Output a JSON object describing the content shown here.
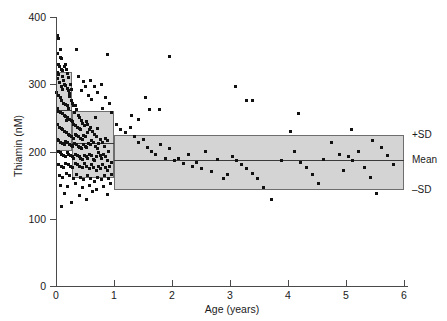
{
  "chart_data": {
    "type": "scatter",
    "title": "",
    "xlabel": "Age (years)",
    "ylabel": "Thiamin (nM)",
    "xlim": [
      0,
      6
    ],
    "ylim": [
      0,
      400
    ],
    "xticks": [
      0,
      1,
      2,
      3,
      4,
      5,
      6
    ],
    "yticks": [
      0,
      100,
      200,
      300,
      400
    ],
    "xtick_labels": [
      "0",
      "1",
      "2",
      "3",
      "4",
      "5",
      "6"
    ],
    "ytick_labels": [
      "0",
      "100",
      "200",
      "300",
      "400"
    ],
    "grid": false,
    "legend": "none",
    "marker": "square",
    "marker_color": "#111111",
    "band_fill_color": "#d4d4d4",
    "band_edge_color": "#6e6e6e",
    "annotations": [
      {
        "label": "+SD",
        "value": 225
      },
      {
        "label": "Mean",
        "value": 187
      },
      {
        "label": "–SD",
        "value": 143
      }
    ],
    "reference_bands": [
      {
        "age_from": 0.0,
        "age_to": 0.28,
        "minus_sd": 200,
        "mean": 262,
        "plus_sd": 318
      },
      {
        "age_from": 0.28,
        "age_to": 1.0,
        "minus_sd": 160,
        "mean": 213,
        "plus_sd": 260
      },
      {
        "age_from": 1.0,
        "age_to": 6.0,
        "minus_sd": 143,
        "mean": 187,
        "plus_sd": 225
      }
    ],
    "points": [
      [
        0.02,
        372
      ],
      [
        0.05,
        368
      ],
      [
        0.08,
        352
      ],
      [
        0.03,
        345
      ],
      [
        0.07,
        340
      ],
      [
        0.1,
        338
      ],
      [
        0.04,
        330
      ],
      [
        0.06,
        326
      ],
      [
        0.09,
        322
      ],
      [
        0.12,
        320
      ],
      [
        0.02,
        318
      ],
      [
        0.05,
        314
      ],
      [
        0.11,
        312
      ],
      [
        0.14,
        326
      ],
      [
        0.16,
        330
      ],
      [
        0.18,
        322
      ],
      [
        0.2,
        316
      ],
      [
        0.22,
        310
      ],
      [
        0.13,
        305
      ],
      [
        0.15,
        300
      ],
      [
        0.17,
        298
      ],
      [
        0.19,
        294
      ],
      [
        0.21,
        290
      ],
      [
        0.23,
        286
      ],
      [
        0.03,
        308
      ],
      [
        0.06,
        302
      ],
      [
        0.09,
        296
      ],
      [
        0.12,
        292
      ],
      [
        0.01,
        288
      ],
      [
        0.04,
        284
      ],
      [
        0.07,
        280
      ],
      [
        0.1,
        276
      ],
      [
        0.13,
        272
      ],
      [
        0.16,
        270
      ],
      [
        0.19,
        268
      ],
      [
        0.22,
        264
      ],
      [
        0.25,
        300
      ],
      [
        0.27,
        292
      ],
      [
        0.24,
        282
      ],
      [
        0.26,
        276
      ],
      [
        0.28,
        272
      ],
      [
        0.3,
        268
      ],
      [
        0.02,
        264
      ],
      [
        0.05,
        260
      ],
      [
        0.08,
        258
      ],
      [
        0.11,
        256
      ],
      [
        0.14,
        254
      ],
      [
        0.17,
        252
      ],
      [
        0.2,
        250
      ],
      [
        0.23,
        248
      ],
      [
        0.26,
        246
      ],
      [
        0.29,
        244
      ],
      [
        0.32,
        258
      ],
      [
        0.35,
        262
      ],
      [
        0.38,
        254
      ],
      [
        0.41,
        250
      ],
      [
        0.44,
        246
      ],
      [
        0.31,
        240
      ],
      [
        0.34,
        238
      ],
      [
        0.37,
        236
      ],
      [
        0.4,
        234
      ],
      [
        0.43,
        232
      ],
      [
        0.46,
        242
      ],
      [
        0.49,
        238
      ],
      [
        0.52,
        244
      ],
      [
        0.55,
        240
      ],
      [
        0.03,
        240
      ],
      [
        0.06,
        236
      ],
      [
        0.09,
        234
      ],
      [
        0.12,
        232
      ],
      [
        0.15,
        230
      ],
      [
        0.18,
        228
      ],
      [
        0.21,
        226
      ],
      [
        0.24,
        224
      ],
      [
        0.27,
        222
      ],
      [
        0.3,
        220
      ],
      [
        0.33,
        226
      ],
      [
        0.36,
        224
      ],
      [
        0.39,
        222
      ],
      [
        0.42,
        220
      ],
      [
        0.45,
        218
      ],
      [
        0.48,
        224
      ],
      [
        0.51,
        222
      ],
      [
        0.54,
        228
      ],
      [
        0.57,
        232
      ],
      [
        0.6,
        236
      ],
      [
        0.63,
        230
      ],
      [
        0.66,
        226
      ],
      [
        0.69,
        222
      ],
      [
        0.72,
        234
      ],
      [
        0.02,
        218
      ],
      [
        0.05,
        216
      ],
      [
        0.08,
        214
      ],
      [
        0.11,
        212
      ],
      [
        0.14,
        210
      ],
      [
        0.17,
        215
      ],
      [
        0.2,
        213
      ],
      [
        0.23,
        211
      ],
      [
        0.26,
        209
      ],
      [
        0.29,
        207
      ],
      [
        0.32,
        212
      ],
      [
        0.35,
        210
      ],
      [
        0.38,
        208
      ],
      [
        0.41,
        206
      ],
      [
        0.44,
        204
      ],
      [
        0.47,
        210
      ],
      [
        0.5,
        208
      ],
      [
        0.53,
        206
      ],
      [
        0.56,
        212
      ],
      [
        0.59,
        210
      ],
      [
        0.62,
        216
      ],
      [
        0.65,
        214
      ],
      [
        0.68,
        208
      ],
      [
        0.71,
        204
      ],
      [
        0.74,
        212
      ],
      [
        0.77,
        218
      ],
      [
        0.8,
        214
      ],
      [
        0.83,
        208
      ],
      [
        0.86,
        220
      ],
      [
        0.89,
        216
      ],
      [
        0.04,
        200
      ],
      [
        0.07,
        198
      ],
      [
        0.1,
        196
      ],
      [
        0.13,
        194
      ],
      [
        0.16,
        192
      ],
      [
        0.19,
        198
      ],
      [
        0.22,
        196
      ],
      [
        0.25,
        194
      ],
      [
        0.28,
        192
      ],
      [
        0.31,
        190
      ],
      [
        0.34,
        196
      ],
      [
        0.37,
        194
      ],
      [
        0.4,
        192
      ],
      [
        0.43,
        190
      ],
      [
        0.46,
        188
      ],
      [
        0.49,
        194
      ],
      [
        0.52,
        192
      ],
      [
        0.55,
        190
      ],
      [
        0.58,
        196
      ],
      [
        0.61,
        194
      ],
      [
        0.64,
        188
      ],
      [
        0.67,
        186
      ],
      [
        0.7,
        192
      ],
      [
        0.73,
        198
      ],
      [
        0.76,
        194
      ],
      [
        0.79,
        190
      ],
      [
        0.82,
        196
      ],
      [
        0.85,
        192
      ],
      [
        0.88,
        186
      ],
      [
        0.91,
        200
      ],
      [
        0.05,
        180
      ],
      [
        0.09,
        178
      ],
      [
        0.13,
        176
      ],
      [
        0.17,
        182
      ],
      [
        0.21,
        180
      ],
      [
        0.25,
        178
      ],
      [
        0.29,
        176
      ],
      [
        0.33,
        182
      ],
      [
        0.37,
        180
      ],
      [
        0.41,
        178
      ],
      [
        0.45,
        176
      ],
      [
        0.49,
        182
      ],
      [
        0.53,
        178
      ],
      [
        0.57,
        174
      ],
      [
        0.61,
        180
      ],
      [
        0.65,
        176
      ],
      [
        0.69,
        172
      ],
      [
        0.73,
        178
      ],
      [
        0.77,
        174
      ],
      [
        0.81,
        180
      ],
      [
        0.85,
        176
      ],
      [
        0.89,
        172
      ],
      [
        0.93,
        178
      ],
      [
        0.96,
        184
      ],
      [
        0.06,
        165
      ],
      [
        0.12,
        162
      ],
      [
        0.18,
        168
      ],
      [
        0.24,
        164
      ],
      [
        0.3,
        160
      ],
      [
        0.36,
        166
      ],
      [
        0.42,
        162
      ],
      [
        0.48,
        158
      ],
      [
        0.54,
        164
      ],
      [
        0.6,
        160
      ],
      [
        0.66,
        156
      ],
      [
        0.72,
        162
      ],
      [
        0.78,
        158
      ],
      [
        0.84,
        164
      ],
      [
        0.9,
        160
      ],
      [
        0.95,
        166
      ],
      [
        0.08,
        150
      ],
      [
        0.2,
        148
      ],
      [
        0.34,
        152
      ],
      [
        0.46,
        146
      ],
      [
        0.58,
        150
      ],
      [
        0.7,
        144
      ],
      [
        0.82,
        148
      ],
      [
        0.94,
        152
      ],
      [
        0.15,
        138
      ],
      [
        0.4,
        134
      ],
      [
        0.63,
        140
      ],
      [
        0.88,
        136
      ],
      [
        0.1,
        118
      ],
      [
        0.26,
        124
      ],
      [
        0.52,
        128
      ],
      [
        0.34,
        268
      ],
      [
        0.44,
        290
      ],
      [
        0.5,
        296
      ],
      [
        0.56,
        284
      ],
      [
        0.62,
        278
      ],
      [
        0.48,
        304
      ],
      [
        0.38,
        312
      ],
      [
        0.66,
        296
      ],
      [
        0.72,
        288
      ],
      [
        0.78,
        300
      ],
      [
        0.6,
        306
      ],
      [
        0.86,
        280
      ],
      [
        0.92,
        272
      ],
      [
        0.8,
        264
      ],
      [
        0.96,
        258
      ],
      [
        0.68,
        250
      ],
      [
        1.05,
        240
      ],
      [
        1.12,
        232
      ],
      [
        1.2,
        228
      ],
      [
        1.28,
        236
      ],
      [
        1.35,
        222
      ],
      [
        1.42,
        214
      ],
      [
        1.5,
        218
      ],
      [
        1.58,
        206
      ],
      [
        1.65,
        200
      ],
      [
        1.72,
        196
      ],
      [
        1.8,
        210
      ],
      [
        1.88,
        190
      ],
      [
        1.95,
        204
      ],
      [
        1.55,
        280
      ],
      [
        1.62,
        262
      ],
      [
        1.78,
        262
      ],
      [
        1.3,
        254
      ],
      [
        1.42,
        248
      ],
      [
        2.05,
        186
      ],
      [
        2.12,
        190
      ],
      [
        2.2,
        182
      ],
      [
        2.28,
        196
      ],
      [
        2.35,
        178
      ],
      [
        2.42,
        184
      ],
      [
        2.5,
        174
      ],
      [
        2.58,
        200
      ],
      [
        2.68,
        170
      ],
      [
        2.78,
        188
      ],
      [
        2.88,
        160
      ],
      [
        2.96,
        166
      ],
      [
        3.05,
        192
      ],
      [
        3.12,
        186
      ],
      [
        3.2,
        180
      ],
      [
        3.28,
        174
      ],
      [
        3.38,
        168
      ],
      [
        3.48,
        160
      ],
      [
        3.58,
        146
      ],
      [
        3.1,
        296
      ],
      [
        3.28,
        276
      ],
      [
        3.38,
        276
      ],
      [
        3.72,
        128
      ],
      [
        3.88,
        186
      ],
      [
        4.05,
        230
      ],
      [
        4.12,
        200
      ],
      [
        4.22,
        184
      ],
      [
        4.32,
        176
      ],
      [
        4.42,
        166
      ],
      [
        4.52,
        152
      ],
      [
        4.62,
        188
      ],
      [
        4.75,
        214
      ],
      [
        4.88,
        196
      ],
      [
        4.95,
        172
      ],
      [
        4.18,
        256
      ],
      [
        5.05,
        192
      ],
      [
        5.12,
        186
      ],
      [
        5.22,
        200
      ],
      [
        5.32,
        176
      ],
      [
        5.42,
        162
      ],
      [
        5.52,
        138
      ],
      [
        5.62,
        206
      ],
      [
        5.72,
        194
      ],
      [
        5.82,
        180
      ],
      [
        5.45,
        216
      ],
      [
        5.1,
        232
      ],
      [
        0.35,
        352
      ],
      [
        0.88,
        344
      ],
      [
        1.95,
        342
      ],
      [
        0.18,
        246
      ],
      [
        0.42,
        206
      ]
    ]
  }
}
